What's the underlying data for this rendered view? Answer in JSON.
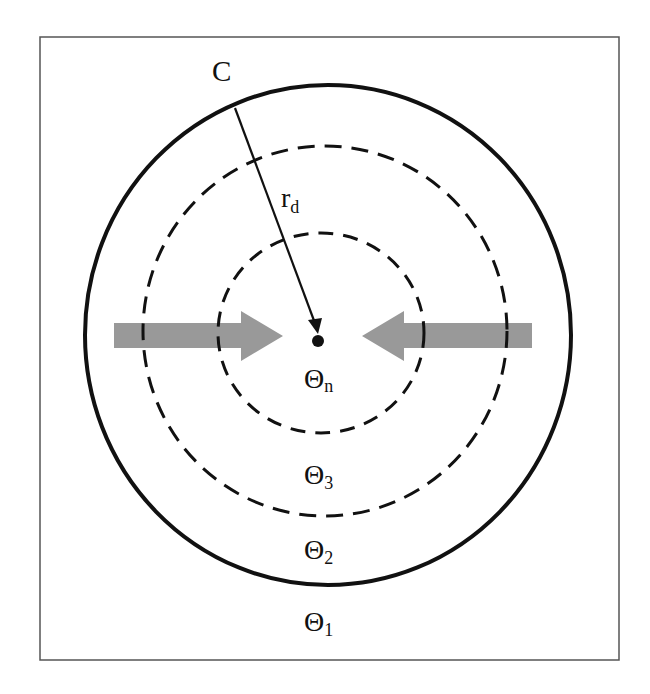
{
  "diagram": {
    "type": "concentric-zones",
    "labels": {
      "boundary": "C",
      "radius": "r",
      "radius_sub": "d",
      "zone_inner": "Θ",
      "zone_inner_sub": "n",
      "zone_3": "Θ",
      "zone_3_sub": "3",
      "zone_2": "Θ",
      "zone_2_sub": "2",
      "zone_1": "Θ",
      "zone_1_sub": "1"
    },
    "colors": {
      "stroke": "#111111",
      "arrow_fill": "#999999",
      "frame": "#555555"
    }
  }
}
